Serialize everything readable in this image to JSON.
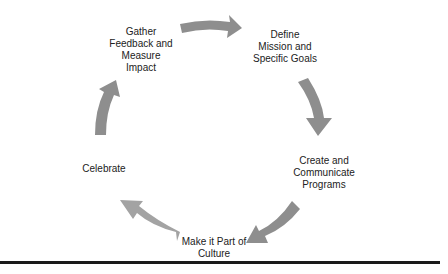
{
  "diagram": {
    "type": "cycle",
    "arrow_color": "#8e8e8e",
    "steps": [
      {
        "label": "Define Mission and Specific Goals",
        "lines": [
          "Define",
          "Mission and",
          "Specific Goals"
        ]
      },
      {
        "label": "Create and Communicate Programs",
        "lines": [
          "Create and",
          "Communicate",
          "Programs"
        ]
      },
      {
        "label": "Make it Part of Culture",
        "lines": [
          "Make it Part of",
          "Culture"
        ]
      },
      {
        "label": "Celebrate",
        "lines": [
          "Celebrate"
        ]
      },
      {
        "label": "Gather Feedback and Measure Impact",
        "lines": [
          "Gather",
          "Feedback and",
          "Measure",
          "Impact"
        ]
      }
    ]
  }
}
